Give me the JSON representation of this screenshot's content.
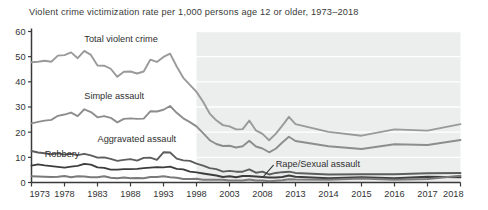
{
  "chart_data": {
    "type": "line",
    "title": "Violent crime victimization rate per 1,000 persons age 12 or older, 1973–2018",
    "xlabel": "",
    "ylabel": "",
    "ylim": [
      0,
      60
    ],
    "yticks": [
      0,
      10,
      20,
      30,
      40,
      50,
      60
    ],
    "ytick_labels": [
      "0",
      "10",
      "20",
      "30",
      "40",
      "50",
      "60"
    ],
    "grid": "horizontal",
    "legend_position": "inline-annotations",
    "xtick_labels": [
      "1973",
      "1978",
      "1983",
      "1988",
      "1993",
      "1998",
      "2003",
      "2008",
      "2013",
      "2014",
      "2015",
      "2016",
      "2017",
      "2018"
    ],
    "x": [
      1973,
      1974,
      1975,
      1976,
      1977,
      1978,
      1979,
      1980,
      1981,
      1982,
      1983,
      1984,
      1985,
      1986,
      1987,
      1988,
      1989,
      1990,
      1991,
      1992,
      1993,
      1994,
      1995,
      1996,
      1997,
      1998,
      1999,
      2000,
      2001,
      2002,
      2003,
      2004,
      2005,
      2006,
      2007,
      2008,
      2009,
      2010,
      2011,
      2012,
      2013,
      2014,
      2015,
      2016,
      2017,
      2018
    ],
    "shaded_region": {
      "label": "redesign period",
      "x_start": 1998,
      "x_end": 2018,
      "color": "#eceded"
    },
    "annotations": [
      {
        "text": "Total violent crime",
        "x": 1981,
        "y": 56
      },
      {
        "text": "Simple assault",
        "x": 1981,
        "y": 33
      },
      {
        "text": "Aggravated assault",
        "x": 1983,
        "y": 16
      },
      {
        "text": "Robbery",
        "x": 1975,
        "y": 10
      },
      {
        "text": "Rape/Sexual assault",
        "x": 2010,
        "y": 6,
        "leader": true
      }
    ],
    "series": [
      {
        "name": "Total violent crime",
        "color": "#9a9a9a",
        "values": [
          47.8,
          48.0,
          48.4,
          48.0,
          50.4,
          50.6,
          51.7,
          49.4,
          52.3,
          50.7,
          46.5,
          46.4,
          45.2,
          42.0,
          44.0,
          44.1,
          43.3,
          44.1,
          48.8,
          47.9,
          49.9,
          51.2,
          46.1,
          41.6,
          38.8,
          36.0,
          32.1,
          27.4,
          24.7,
          22.8,
          22.3,
          21.1,
          21.2,
          24.6,
          20.7,
          19.3,
          16.8,
          19.3,
          22.6,
          26.1,
          23.2,
          20.1,
          18.6,
          21.1,
          20.6,
          23.2
        ]
      },
      {
        "name": "Simple assault",
        "color": "#8d8d8d",
        "values": [
          23.5,
          24.1,
          24.6,
          24.9,
          26.5,
          27.0,
          27.8,
          26.4,
          29.1,
          28.0,
          25.9,
          26.4,
          25.7,
          23.9,
          25.3,
          25.5,
          25.3,
          25.4,
          28.3,
          28.2,
          28.9,
          30.4,
          27.7,
          25.5,
          24.0,
          22.3,
          19.6,
          16.8,
          15.3,
          14.5,
          14.6,
          13.9,
          14.4,
          16.6,
          14.3,
          13.5,
          12.0,
          13.4,
          15.9,
          18.2,
          16.5,
          14.4,
          13.3,
          15.2,
          14.9,
          16.9
        ]
      },
      {
        "name": "Aggravated assault",
        "color": "#5e5e5e",
        "values": [
          12.5,
          11.9,
          11.6,
          11.2,
          11.6,
          11.1,
          11.4,
          10.9,
          11.4,
          10.8,
          9.9,
          10.0,
          9.4,
          8.6,
          9.0,
          9.3,
          8.7,
          9.8,
          9.9,
          9.0,
          12.0,
          11.9,
          9.5,
          8.8,
          8.6,
          7.5,
          6.7,
          5.7,
          5.3,
          4.3,
          4.6,
          4.3,
          4.3,
          5.2,
          3.9,
          4.3,
          3.2,
          3.8,
          4.1,
          4.3,
          3.8,
          3.2,
          3.3,
          3.3,
          3.7,
          3.8
        ]
      },
      {
        "name": "Robbery",
        "color": "#3d3d3d",
        "values": [
          6.7,
          7.2,
          6.8,
          6.5,
          6.2,
          5.9,
          6.3,
          6.6,
          7.4,
          7.1,
          6.0,
          5.8,
          5.1,
          5.1,
          5.3,
          5.3,
          5.4,
          5.7,
          5.9,
          6.1,
          6.0,
          6.3,
          5.4,
          5.2,
          4.3,
          4.0,
          3.6,
          3.2,
          2.8,
          2.2,
          2.5,
          2.1,
          2.6,
          2.6,
          2.4,
          2.2,
          2.0,
          2.0,
          2.2,
          2.8,
          2.3,
          1.7,
          2.1,
          1.7,
          2.3,
          2.1
        ]
      },
      {
        "name": "Rape/Sexual assault",
        "color": "#7a7a7a",
        "values": [
          2.5,
          2.4,
          2.3,
          2.2,
          2.3,
          2.6,
          2.1,
          2.5,
          2.4,
          2.1,
          2.1,
          2.5,
          1.9,
          1.7,
          2.0,
          1.7,
          1.8,
          1.7,
          2.2,
          2.2,
          2.5,
          2.1,
          1.9,
          1.4,
          1.4,
          1.5,
          1.1,
          1.1,
          1.1,
          1.1,
          0.8,
          0.8,
          0.8,
          1.2,
          0.8,
          0.8,
          0.5,
          0.7,
          0.9,
          1.3,
          1.2,
          1.1,
          1.6,
          1.1,
          1.4,
          2.7
        ]
      }
    ]
  }
}
